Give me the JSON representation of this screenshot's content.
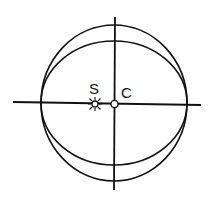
{
  "diagram": {
    "labels": {
      "sun": "S",
      "center": "C"
    },
    "colors": {
      "stroke": "#111111",
      "background": "#ffffff"
    },
    "elements": {
      "outer_circle": {
        "cx": 114,
        "cy": 103,
        "rx": 73,
        "ry": 78
      },
      "inner_ellipse": {
        "cx": 114,
        "cy": 103,
        "rx": 73,
        "ry": 62
      },
      "horizontal_axis": {
        "x1": 13,
        "y1": 103,
        "x2": 201,
        "y2": 105
      },
      "vertical_axis": {
        "x1": 115,
        "y1": 17,
        "x2": 114,
        "y2": 190
      },
      "sun_marker": {
        "cx": 95,
        "cy": 104,
        "icon": "sun-icon"
      },
      "center_marker": {
        "cx": 114,
        "cy": 104,
        "icon": "open-circle"
      }
    }
  }
}
